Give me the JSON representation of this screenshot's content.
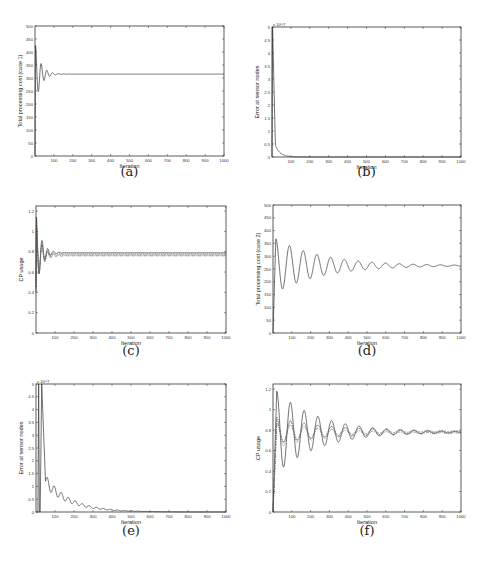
{
  "chart_data": [
    {
      "id": "a",
      "type": "line",
      "caption": "(a)",
      "xlabel": "Iteration",
      "ylabel": "Total processing cost (case 1)",
      "xlim": [
        0,
        1000
      ],
      "ylim": [
        0,
        500
      ],
      "xticks": [
        100,
        200,
        300,
        400,
        500,
        600,
        700,
        800,
        900,
        1000
      ],
      "yticks": [
        0,
        50,
        100,
        150,
        200,
        250,
        300,
        350,
        400,
        450,
        500
      ],
      "ytick_labels": [
        "0",
        "50",
        "100",
        "150",
        "200",
        "250",
        "300",
        "350",
        "400",
        "450",
        "500"
      ],
      "exponent_label": "",
      "series": [
        {
          "name": "cost",
          "model": "damped",
          "start": 0,
          "final": 315,
          "amp": 110,
          "period": 30,
          "decay": 30,
          "rise": 3
        }
      ]
    },
    {
      "id": "b",
      "type": "line",
      "caption": "(b)",
      "xlabel": "Iteration",
      "ylabel": "Error at sensor nodes",
      "xlim": [
        0,
        1000
      ],
      "ylim": [
        0,
        5
      ],
      "xticks": [
        100,
        200,
        300,
        400,
        500,
        600,
        700,
        800,
        900,
        1000
      ],
      "yticks": [
        0,
        0.5,
        1,
        1.5,
        2,
        2.5,
        3,
        3.5,
        4,
        4.5,
        5
      ],
      "ytick_labels": [
        "0",
        "0.5",
        "1",
        "1.5",
        "2",
        "2.5",
        "3",
        "3.5",
        "4",
        "4.5",
        "5"
      ],
      "exponent_label": "x 10^7",
      "series": [
        {
          "name": "error",
          "model": "spike-decay",
          "peak": 5,
          "peak_x": 3,
          "knee_x": 18,
          "knee_y": 0.45,
          "tail": 25
        }
      ]
    },
    {
      "id": "c",
      "type": "line",
      "caption": "(c)",
      "xlabel": "Iteration",
      "ylabel": "CP usage",
      "xlim": [
        0,
        1000
      ],
      "ylim": [
        0,
        1.25
      ],
      "xticks": [
        100,
        200,
        300,
        400,
        500,
        600,
        700,
        800,
        900,
        1000
      ],
      "yticks": [
        0,
        0.2,
        0.4,
        0.6,
        0.8,
        1,
        1.2
      ],
      "ytick_labels": [
        "0",
        "0.2",
        "0.4",
        "0.6",
        "0.8",
        "1",
        "1.2"
      ],
      "exponent_label": "",
      "series": [
        {
          "name": "cp1",
          "model": "damped",
          "start": 0.4,
          "final": 0.79,
          "amp": 0.35,
          "period": 30,
          "decay": 28,
          "rise": 2,
          "dash": ""
        },
        {
          "name": "cp2",
          "model": "damped",
          "start": 0.45,
          "final": 0.77,
          "amp": 0.3,
          "period": 30,
          "decay": 28,
          "rise": 2,
          "dash": "2,1"
        },
        {
          "name": "cp3",
          "model": "damped",
          "start": 0.5,
          "final": 0.78,
          "amp": 0.25,
          "period": 30,
          "decay": 28,
          "rise": 2,
          "dash": "1,1"
        },
        {
          "name": "cp4",
          "model": "damped",
          "start": 0.45,
          "final": 0.76,
          "amp": 0.3,
          "period": 30,
          "decay": 28,
          "rise": 2,
          "dash": "3,1,1,1"
        }
      ]
    },
    {
      "id": "d",
      "type": "line",
      "caption": "(d)",
      "xlabel": "Iteration",
      "ylabel": "Total processing cost (case 2)",
      "xlim": [
        0,
        1000
      ],
      "ylim": [
        0,
        500
      ],
      "xticks": [
        100,
        200,
        300,
        400,
        500,
        600,
        700,
        800,
        900,
        1000
      ],
      "yticks": [
        0,
        50,
        100,
        150,
        200,
        250,
        300,
        350,
        400,
        450,
        500
      ],
      "ytick_labels": [
        "0",
        "50",
        "100",
        "150",
        "200",
        "250",
        "300",
        "350",
        "400",
        "450",
        "500"
      ],
      "exponent_label": "",
      "series": [
        {
          "name": "cost",
          "model": "damped",
          "start": 0,
          "final": 263,
          "amp": 105,
          "period": 73,
          "decay": 250,
          "rise": 15,
          "phase": 0
        }
      ]
    },
    {
      "id": "e",
      "type": "line",
      "caption": "(e)",
      "xlabel": "Iteration",
      "ylabel": "Error at sensor nodes",
      "xlim": [
        0,
        1000
      ],
      "ylim": [
        0,
        5
      ],
      "xticks": [
        100,
        200,
        300,
        400,
        500,
        600,
        700,
        800,
        900,
        1000
      ],
      "yticks": [
        0,
        0.5,
        1,
        1.5,
        2,
        2.5,
        3,
        3.5,
        4,
        4.5,
        5
      ],
      "ytick_labels": [
        "0",
        "0.5",
        "1",
        "1.5",
        "2",
        "2.5",
        "3",
        "3.5",
        "4",
        "4.5",
        "5"
      ],
      "exponent_label": "x 10^7",
      "series": [
        {
          "name": "error",
          "model": "spike-osc",
          "peak": 5,
          "peak_x": 30,
          "knee_x": 50,
          "knee_y": 1.2,
          "tail": 130,
          "amp": 0.25,
          "period": 37
        }
      ]
    },
    {
      "id": "f",
      "type": "line",
      "caption": "(f)",
      "xlabel": "Iteration",
      "ylabel": "CP usage",
      "xlim": [
        0,
        1000
      ],
      "ylim": [
        0,
        1.25
      ],
      "xticks": [
        100,
        200,
        300,
        400,
        500,
        600,
        700,
        800,
        900,
        1000
      ],
      "yticks": [
        0,
        0.2,
        0.4,
        0.6,
        0.8,
        1,
        1.2
      ],
      "ytick_labels": [
        "0",
        "0.2",
        "0.4",
        "0.6",
        "0.8",
        "1",
        "1.2"
      ],
      "exponent_label": "",
      "series": [
        {
          "name": "cp1",
          "model": "damped",
          "start": 0,
          "final": 0.78,
          "amp": 0.4,
          "period": 73,
          "decay": 230,
          "rise": 20,
          "dash": ""
        },
        {
          "name": "cp2",
          "model": "damped",
          "start": 0,
          "final": 0.79,
          "amp": 0.12,
          "period": 73,
          "decay": 300,
          "rise": 20,
          "dash": "2,1"
        },
        {
          "name": "cp3",
          "model": "damped",
          "start": 0,
          "final": 0.78,
          "amp": 0.15,
          "period": 73,
          "decay": 300,
          "rise": 20,
          "dash": "1,1"
        },
        {
          "name": "cp4",
          "model": "damped",
          "start": 0,
          "final": 0.77,
          "amp": 0.1,
          "period": 73,
          "decay": 300,
          "rise": 20,
          "dash": "3,1,1,1"
        }
      ]
    }
  ]
}
